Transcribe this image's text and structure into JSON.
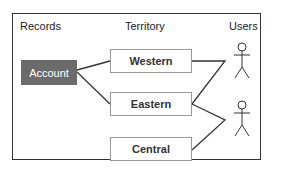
{
  "headers": {
    "records": "Records",
    "territory": "Territory",
    "users": "Users"
  },
  "records": [
    {
      "label": "Account"
    }
  ],
  "territories": [
    {
      "label": "Western"
    },
    {
      "label": "Eastern"
    },
    {
      "label": "Central"
    }
  ],
  "users": [
    {
      "icon": "stick-figure-icon"
    },
    {
      "icon": "stick-figure-icon"
    }
  ],
  "colors": {
    "account_fill": "#6b6b6b",
    "line": "#333333",
    "box_border": "#999999"
  }
}
